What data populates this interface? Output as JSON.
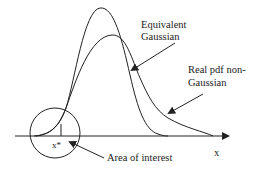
{
  "diagram": {
    "labels": {
      "equivalent_gaussian_line1": "Equivalent",
      "equivalent_gaussian_line2": "Gaussian",
      "real_pdf_line1": "Real pdf non-",
      "real_pdf_line2": "Gaussian",
      "x_star": "x*",
      "area_of_interest": "Area of interest",
      "x_axis": "x"
    },
    "colors": {
      "stroke": "#222222",
      "background": "#ffffff"
    }
  }
}
